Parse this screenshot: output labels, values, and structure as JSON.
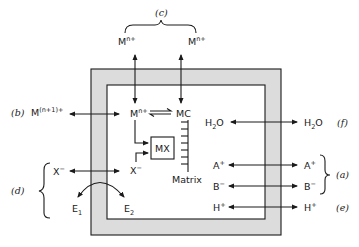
{
  "diagram": {
    "type": "cell membrane metal-ion transport mechanisms",
    "colors": {
      "membrane_fill": "#dcdcdc",
      "stroke": "#1a1a1a",
      "background": "#ffffff"
    },
    "mechanism_labels": {
      "a": "(a)",
      "b": "(b)",
      "c": "(c)",
      "d": "(d)",
      "e": "(e)",
      "f": "(f)"
    },
    "outside_species": {
      "m_top_left": {
        "base": "M",
        "sup": "n+"
      },
      "m_top_right": {
        "base": "M",
        "sup": "n+"
      },
      "m_n1": {
        "base": "M",
        "sup": "(n+1)+"
      },
      "x_outside": {
        "base": "X",
        "sup": "−"
      },
      "e1": {
        "base": "E",
        "sub": "1"
      },
      "h2o_out": {
        "base": "H",
        "sub": "2",
        "tail": "O"
      },
      "a_out": {
        "base": "A",
        "sup": "+"
      },
      "b_out": {
        "base": "B",
        "sup": "−"
      },
      "h_out": {
        "base": "H",
        "sup": "+"
      }
    },
    "inside_species": {
      "m_in": {
        "base": "M",
        "sup": "n+"
      },
      "mc": "MC",
      "mx": "MX",
      "x_inside": {
        "base": "X",
        "sup": "−"
      },
      "e2": {
        "base": "E",
        "sub": "2"
      },
      "matrix": "Matrix",
      "h2o_in": {
        "base": "H",
        "sub": "2",
        "tail": "O"
      },
      "a_in": {
        "base": "A",
        "sup": "+"
      },
      "b_in": {
        "base": "B",
        "sup": "−"
      },
      "h_in": {
        "base": "H",
        "sup": "+"
      }
    }
  }
}
